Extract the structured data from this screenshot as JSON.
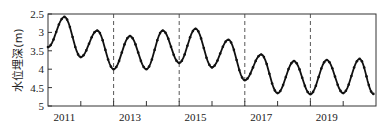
{
  "chart_data": {
    "type": "line",
    "title": "",
    "xlabel": "",
    "ylabel": "水位埋深(m)",
    "y_inverted": true,
    "ylim": [
      2.5,
      5
    ],
    "xlim": [
      2011,
      2021
    ],
    "yticks": [
      "2.5",
      "3",
      "3.5",
      "4",
      "4.5",
      "5"
    ],
    "ytick_values": [
      2.5,
      3,
      3.5,
      4,
      4.5,
      5
    ],
    "xtick_labels": [
      "2011",
      "2013",
      "2015",
      "2017",
      "2019"
    ],
    "xtick_label_positions": [
      2011.5,
      2013.5,
      2015.5,
      2017.5,
      2019.5
    ],
    "xtick_marks": [
      2012,
      2013,
      2014,
      2015,
      2016,
      2017,
      2018,
      2019,
      2020
    ],
    "dashed_vlines": [
      2013,
      2015,
      2017,
      2019
    ],
    "grid": false,
    "legend": null,
    "marker": "small dots (monthly)",
    "series": [
      {
        "name": "水位埋深",
        "color": "#111111",
        "x": [
          2011.0,
          2011.5,
          2012.0,
          2012.5,
          2013.0,
          2013.5,
          2014.0,
          2014.5,
          2015.0,
          2015.5,
          2016.0,
          2016.5,
          2017.0,
          2017.5,
          2018.0,
          2018.5,
          2019.0,
          2019.5,
          2020.0,
          2020.5,
          2020.92
        ],
        "values": [
          3.4,
          2.58,
          3.67,
          2.95,
          4.0,
          3.1,
          4.0,
          2.95,
          3.83,
          2.9,
          3.95,
          3.2,
          4.3,
          3.6,
          4.65,
          3.78,
          4.68,
          3.75,
          4.65,
          3.72,
          4.67
        ]
      }
    ]
  }
}
